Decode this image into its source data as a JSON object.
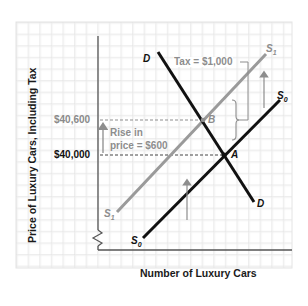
{
  "diagram": {
    "type": "supply-demand-tax-incidence",
    "axes": {
      "y_label": "Price of Luxury Cars, Including Tax",
      "x_label": "Number of Luxury Cars",
      "axis_break": true
    },
    "price_levels": [
      {
        "label": "$40,600",
        "point": "B",
        "color": "#8a8a8a"
      },
      {
        "label": "$40,000",
        "point": "A",
        "color": "#111111"
      }
    ],
    "annotations": {
      "rise_line1": "Rise in",
      "rise_line2": "price = $600",
      "tax_label": "Tax = $1,000"
    },
    "curves": {
      "demand_top": "D",
      "demand_bottom": "D",
      "supply_original": {
        "name": "S",
        "sub": "0",
        "color": "#111111"
      },
      "supply_taxed": {
        "name": "S",
        "sub": "1",
        "color": "#8d8d8d"
      }
    },
    "points": {
      "B": "B",
      "A": "A"
    },
    "colors": {
      "grid": "#dcdcdc",
      "axis": "#555555",
      "black_curve": "#111111",
      "gray_curve": "#9a9a9a"
    }
  }
}
